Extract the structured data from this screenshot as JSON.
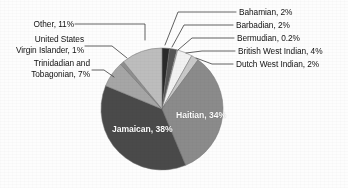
{
  "chart_data": {
    "type": "pie",
    "title": "",
    "subtitle": "",
    "xlabel": "",
    "ylabel": "",
    "legend_position": "none",
    "grid": false,
    "labels_shown": "category name and percentage",
    "categories": [
      "Jamaican",
      "Haitian",
      "Other",
      "Trinidadian and Tobagonian",
      "United States Virgin Islander",
      "British West Indian",
      "Bahamian",
      "Barbadian",
      "Dutch West Indian",
      "Bermudian"
    ],
    "values": [
      38,
      34,
      11,
      7,
      1,
      4,
      2,
      2,
      2,
      0.2
    ],
    "value_labels": [
      "38%",
      "34%",
      "11%",
      "7%",
      "1%",
      "4%",
      "2%",
      "2%",
      "2%",
      "0.2%"
    ],
    "units": "percent",
    "slices": [
      {
        "name": "Bahamian",
        "value": 2,
        "value_label": "2%",
        "color": "#2a2a2a",
        "label_text": "Bahamian, 2%",
        "label_placement": "outside-right"
      },
      {
        "name": "Barbadian",
        "value": 2,
        "value_label": "2%",
        "color": "#565656",
        "label_text": "Barbadian, 2%",
        "label_placement": "outside-right"
      },
      {
        "name": "Bermudian",
        "value": 0.2,
        "value_label": "0.2%",
        "color": "#fafafa",
        "label_text": "Bermudian, 0.2%",
        "label_placement": "outside-right"
      },
      {
        "name": "British West Indian",
        "value": 4,
        "value_label": "4%",
        "color": "#f2f2f2",
        "label_text": "British West Indian, 4%",
        "label_placement": "outside-right"
      },
      {
        "name": "Dutch West Indian",
        "value": 2,
        "value_label": "2%",
        "color": "#c9c9c9",
        "label_text": "Dutch West Indian, 2%",
        "label_placement": "outside-right"
      },
      {
        "name": "Haitian",
        "value": 34,
        "value_label": "34%",
        "color": "#8b8b8b",
        "label_text": "Haitian, 34%",
        "label_placement": "inside"
      },
      {
        "name": "Jamaican",
        "value": 38,
        "value_label": "38%",
        "color": "#4a4a4a",
        "label_text": "Jamaican, 38%",
        "label_placement": "inside"
      },
      {
        "name": "Trinidadian and Tobagonian",
        "value": 7,
        "value_label": "7%",
        "color": "#a6a6a6",
        "label_text": "Trinidadian and Tobagonian, 7%",
        "label_placement": "outside-left"
      },
      {
        "name": "United States Virgin Islander",
        "value": 1,
        "value_label": "1%",
        "color": "#8f8f8f",
        "label_text": "United States Virgin Islander, 1%",
        "label_placement": "outside-left"
      },
      {
        "name": "Other",
        "value": 11,
        "value_label": "11%",
        "color": "#bdbdbd",
        "label_text": "Other, 11%",
        "label_placement": "outside-left"
      }
    ]
  },
  "labels": {
    "left": {
      "other": "Other, 11%",
      "usvi_line1": "United States",
      "usvi_line2": "Virgin Islander, 1%",
      "trinidad_line1": "Trinidadian and",
      "trinidad_line2": "Tobagonian, 7%"
    },
    "right": {
      "bahamian": "Bahamian, 2%",
      "barbadian": "Barbadian, 2%",
      "bermudian": "Bermudian, 0.2%",
      "british_west_indian": "British West Indian, 4%",
      "dutch_west_indian": "Dutch West Indian, 2%"
    },
    "inside": {
      "haitian": "Haitian, 34%",
      "jamaican": "Jamaican, 38%"
    }
  },
  "colors": {
    "background": "#fdfdfd",
    "text": "#111111",
    "inside_text": "#ffffff",
    "leader_line": "#3a3a3a",
    "slice_outline": "#6e6e6e"
  }
}
